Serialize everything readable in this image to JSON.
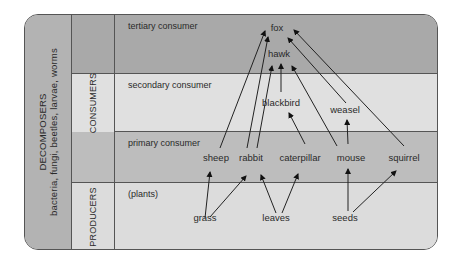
{
  "decomposers": {
    "title": "DECOMPOSERS",
    "examples": "bacteria, fungi, beetles, larvae, worms"
  },
  "groups": {
    "consumers": "CONSUMERS",
    "producers": "PRODUCERS"
  },
  "levels": [
    {
      "id": "tertiary",
      "label": "tertiary consumer",
      "color": "#a9a9a9"
    },
    {
      "id": "secondary",
      "label": "secondary consumer",
      "color": "#e0e0e0"
    },
    {
      "id": "primary",
      "label": "primary consumer",
      "color": "#bdbdbd"
    },
    {
      "id": "producers",
      "label": "(plants)",
      "color": "#dcdcdc"
    }
  ],
  "organisms": {
    "fox": "fox",
    "hawk": "hawk",
    "blackbird": "blackbird",
    "weasel": "weasel",
    "sheep": "sheep",
    "rabbit": "rabbit",
    "caterpillar": "caterpillar",
    "mouse": "mouse",
    "squirrel": "squirrel",
    "grass": "grass",
    "leaves": "leaves",
    "seeds": "seeds"
  },
  "food_links": [
    [
      "grass",
      "sheep"
    ],
    [
      "grass",
      "rabbit"
    ],
    [
      "leaves",
      "rabbit"
    ],
    [
      "leaves",
      "caterpillar"
    ],
    [
      "seeds",
      "mouse"
    ],
    [
      "seeds",
      "squirrel"
    ],
    [
      "caterpillar",
      "blackbird"
    ],
    [
      "mouse",
      "weasel"
    ],
    [
      "sheep",
      "fox"
    ],
    [
      "rabbit",
      "fox"
    ],
    [
      "rabbit",
      "hawk"
    ],
    [
      "blackbird",
      "hawk"
    ],
    [
      "mouse",
      "hawk"
    ],
    [
      "weasel",
      "fox"
    ],
    [
      "squirrel",
      "fox"
    ]
  ]
}
